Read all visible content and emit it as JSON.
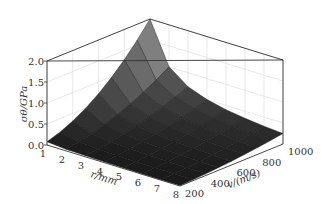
{
  "chart_data": {
    "type": "surface",
    "title": "",
    "xlabel": "r/mm",
    "ylabel": "v/(m/s)",
    "zlabel": "σθ/GPa",
    "x": [
      1,
      2,
      3,
      4,
      5,
      6,
      7,
      8
    ],
    "y": [
      200,
      300,
      400,
      500,
      600,
      700,
      800,
      900,
      1000
    ],
    "xticks": [
      "1",
      "2",
      "3",
      "4",
      "5",
      "6",
      "7",
      "8"
    ],
    "yticks": [
      "200",
      "400",
      "600",
      "800",
      "1000"
    ],
    "yticks_values": [
      200,
      400,
      600,
      800,
      1000
    ],
    "zticks": [
      "0.0",
      "0.5",
      "1.0",
      "1.5",
      "2.0"
    ],
    "zticks_values": [
      0,
      0.5,
      1.0,
      1.5,
      2.0
    ],
    "xlim": [
      1,
      8
    ],
    "ylim": [
      200,
      1000
    ],
    "zlim": [
      0,
      2.0
    ],
    "grid": true,
    "z": [
      [
        0.08,
        0.18,
        0.32,
        0.5,
        0.72,
        0.98,
        1.28,
        1.62,
        2.0
      ],
      [
        0.04,
        0.09,
        0.16,
        0.25,
        0.36,
        0.49,
        0.64,
        0.81,
        1.0
      ],
      [
        0.027,
        0.06,
        0.107,
        0.167,
        0.24,
        0.327,
        0.427,
        0.54,
        0.667
      ],
      [
        0.02,
        0.045,
        0.08,
        0.125,
        0.18,
        0.245,
        0.32,
        0.405,
        0.5
      ],
      [
        0.016,
        0.036,
        0.064,
        0.1,
        0.144,
        0.196,
        0.256,
        0.324,
        0.4
      ],
      [
        0.013,
        0.03,
        0.053,
        0.083,
        0.12,
        0.163,
        0.213,
        0.27,
        0.333
      ],
      [
        0.011,
        0.026,
        0.046,
        0.071,
        0.103,
        0.14,
        0.183,
        0.231,
        0.286
      ],
      [
        0.01,
        0.023,
        0.04,
        0.063,
        0.09,
        0.123,
        0.16,
        0.203,
        0.25
      ]
    ]
  },
  "labels": {
    "z_axis": "σθ/GPa",
    "x_axis": "r/mm",
    "y_axis": "v/(m/s)"
  }
}
